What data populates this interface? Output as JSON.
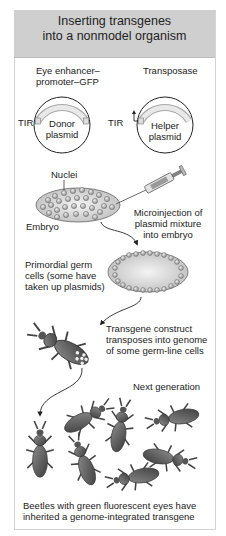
{
  "title": {
    "line1": "Inserting transgenes",
    "line2": "into a nonmodel organism"
  },
  "plasmids": {
    "donor": {
      "insert_label_line1": "Eye enhancer–",
      "insert_label_line2": "promoter–GFP",
      "left_tir": "TIR",
      "right_tir": "TIR",
      "name_line1": "Donor",
      "name_line2": "plasmid"
    },
    "helper": {
      "insert_label": "Transposase",
      "name_line1": "Helper",
      "name_line2": "plasmid"
    }
  },
  "embryo_step": {
    "nuclei_label": "Nuclei",
    "embryo_label": "Embryo",
    "injection_line1": "Microinjection of",
    "injection_line2": "plasmid mixture",
    "injection_line3": "into embryo"
  },
  "germ_step": {
    "line1": "Primordial germ",
    "line2": "cells (some have",
    "line3": "taken up plasmids)"
  },
  "beetle_step": {
    "line1": "Transgene construct",
    "line2": "transposes into genome",
    "line3": "of some germ-line cells"
  },
  "next_generation": {
    "label": "Next generation"
  },
  "caption": {
    "line1": "Beetles with green fluorescent eyes have",
    "line2": "inherited a genome-integrated transgene"
  },
  "colors": {
    "title_bar": "#cfcfcf",
    "plasmid_insert": "#e6e6e6",
    "embryo_fill": "#dcdcdc",
    "beetle": "#5a5a5a"
  }
}
